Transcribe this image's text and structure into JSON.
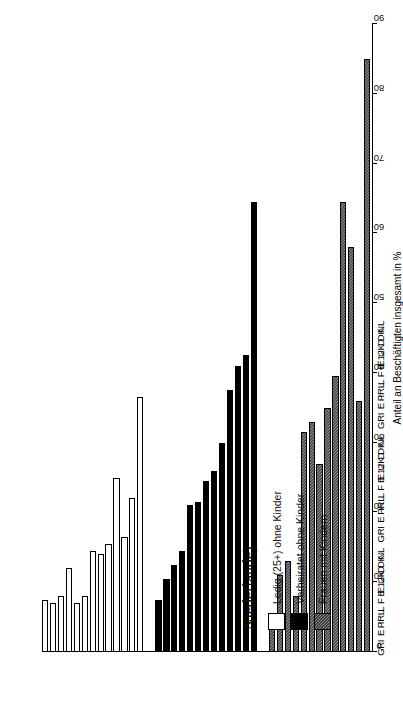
{
  "figure": {
    "legend_title": "Niederlande)",
    "value_axis_title": "Anteil an Beschäftigten insgesamt in %"
  },
  "legend": {
    "items": [
      {
        "label": "Ledig (25+) ohne Kinder",
        "swatch": "white"
      },
      {
        "label": "Verheiratet ohne Kinder",
        "swatch": "black"
      },
      {
        "label": "Frauen mit Kindern",
        "swatch": "hatch"
      }
    ]
  },
  "chart_data": {
    "type": "bar",
    "title": "Niederlande)",
    "xlabel": "",
    "ylabel": "Anteil an Beschäftigten insgesamt in %",
    "ylim": [
      0,
      90
    ],
    "yticks": [
      0,
      10,
      20,
      30,
      40,
      50,
      60,
      70,
      80,
      90
    ],
    "grid": false,
    "orientation": "horizontal",
    "legend_position": "upper-left",
    "categories": [
      "GR",
      "I",
      "E",
      "P",
      "IRL",
      "L",
      "F",
      "B",
      "E12",
      "UK",
      "D",
      "DK",
      "NL"
    ],
    "series": [
      {
        "name": "Ledig (25+) ohne Kinder",
        "swatch": "white",
        "values": [
          7.5,
          7.0,
          8.0,
          12.0,
          7.0,
          8.0,
          14.5,
          14.0,
          15.5,
          25.0,
          16.5,
          22.0,
          36.5
        ]
      },
      {
        "name": "Verheiratet ohne Kinder",
        "swatch": "black",
        "values": [
          7.5,
          10.5,
          12.5,
          14.5,
          21.0,
          21.5,
          24.5,
          26.0,
          30.0,
          37.5,
          41.0,
          42.5,
          64.5
        ]
      },
      {
        "name": "Frauen mit Kindern",
        "swatch": "hatch",
        "values": [
          5.0,
          11.0,
          13.0,
          8.0,
          31.5,
          33.0,
          27.0,
          35.0,
          39.5,
          64.5,
          58.0,
          36.0,
          85.0
        ]
      }
    ]
  }
}
